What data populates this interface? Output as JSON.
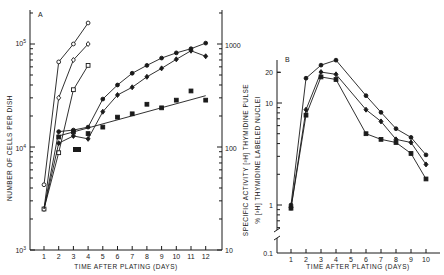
{
  "chart_data": [
    {
      "panel": "A",
      "type": "line",
      "title": "",
      "xlabel": "TIME AFTER PLATING (DAYS)",
      "ylabel": "NUMBER OF CELLS PER DISH",
      "y2label": "",
      "yscale": "log",
      "ylim": [
        1000,
        200000
      ],
      "y2lim": [
        10,
        2000
      ],
      "yticks": [
        "10^3",
        "10^4",
        "10^5"
      ],
      "y2ticks": [
        "10",
        "100",
        "1000"
      ],
      "x": [
        1,
        2,
        3,
        4,
        5,
        6,
        7,
        8,
        9,
        10,
        11,
        12
      ],
      "xticks": [
        "1",
        "2",
        "3",
        "4",
        "5",
        "6",
        "7",
        "8",
        "9",
        "10",
        "11",
        "12"
      ],
      "grid": false,
      "series": [
        {
          "name": "open circles (cells/dish)",
          "axis": "left",
          "marker": "open-circle",
          "x": [
            1,
            2,
            3,
            4
          ],
          "values": [
            4300,
            67000,
            100000,
            160000
          ]
        },
        {
          "name": "open diamonds (cells/dish)",
          "axis": "left",
          "marker": "open-diamond",
          "x": [
            1,
            2,
            3,
            4
          ],
          "values": [
            2500,
            30000,
            70000,
            100000
          ]
        },
        {
          "name": "open squares (cells/dish)",
          "axis": "left",
          "marker": "open-square",
          "x": [
            1,
            2,
            3,
            4
          ],
          "values": [
            2500,
            8800,
            36000,
            62000
          ]
        },
        {
          "name": "filled circles (specific activity)",
          "axis": "right",
          "marker": "filled-circle",
          "x": [
            2,
            3,
            4,
            5,
            6,
            7,
            8,
            9,
            10,
            11,
            12
          ],
          "values": [
            141,
            146,
            156,
            292,
            400,
            520,
            620,
            730,
            820,
            900,
            1020
          ]
        },
        {
          "name": "filled diamonds (specific activity)",
          "axis": "right",
          "marker": "filled-diamond",
          "x": [
            2,
            3,
            4,
            5,
            6,
            7,
            8,
            9,
            10,
            11,
            12
          ],
          "values": [
            109,
            128,
            120,
            220,
            320,
            380,
            480,
            580,
            710,
            860,
            760
          ]
        },
        {
          "name": "filled squares (specific activity)",
          "axis": "right",
          "marker": "filled-square",
          "x": [
            2,
            3,
            4,
            5,
            6,
            7,
            8,
            9,
            10,
            11,
            12
          ],
          "values": [
            125,
            140,
            135,
            156,
            195,
            210,
            260,
            240,
            285,
            350,
            285
          ],
          "fit_line": {
            "x": [
              2,
              12
            ],
            "values": [
              128,
              315
            ]
          }
        }
      ],
      "annotations": [
        "A",
        "black bar at day ~3.2 (plating marker)"
      ]
    },
    {
      "panel": "B",
      "type": "line",
      "title": "",
      "xlabel": "TIME AFTER PLATING (DAYS)",
      "ylabel": "SPECIFIC ACTIVITY [3H] THYMIDINE PULSE / % [3H] THYMIDINE LABELED NUCLEI",
      "yscale": "log",
      "ylim": [
        0.1,
        30
      ],
      "yticks": [
        "0.1",
        "1",
        "10",
        "20"
      ],
      "x": [
        1,
        2,
        3,
        4,
        6,
        7,
        8,
        9,
        10
      ],
      "xticks": [
        "1",
        "2",
        "3",
        "4",
        "5",
        "6",
        "7",
        "8",
        "9",
        "10"
      ],
      "grid": false,
      "axis_break": true,
      "series": [
        {
          "name": "series 1 (circles)",
          "marker": "filled-circle",
          "values": [
            1.0,
            17.5,
            23.5,
            26.3,
            11.8,
            8.1,
            5.6,
            4.6,
            3.1
          ]
        },
        {
          "name": "series 2 (diamonds)",
          "marker": "filled-diamond",
          "values": [
            0.94,
            8.6,
            20.1,
            19.1,
            8.6,
            6.6,
            4.4,
            4.1,
            2.5
          ]
        },
        {
          "name": "series 3 (squares)",
          "marker": "filled-square",
          "values": [
            0.93,
            7.6,
            18.0,
            17.0,
            5.0,
            4.4,
            4.1,
            3.2,
            1.8
          ]
        }
      ],
      "annotations": [
        "B"
      ]
    }
  ],
  "panelA": {
    "label": "A",
    "xlabel": "TIME AFTER PLATING (DAYS)",
    "ylabel": "NUMBER OF CELLS PER DISH",
    "yticks": [
      {
        "text": "10",
        "sup": "3",
        "y": 250
      },
      {
        "text": "10",
        "sup": "4",
        "y": 148
      },
      {
        "text": "10",
        "sup": "5",
        "y": 43
      }
    ],
    "y2ticks": [
      {
        "text": "10",
        "y": 250
      },
      {
        "text": "100",
        "y": 148
      },
      {
        "text": "1000",
        "y": 45
      }
    ],
    "xticks": [
      "1",
      "2",
      "3",
      "4",
      "5",
      "6",
      "7",
      "8",
      "9",
      "10",
      "11",
      "12"
    ]
  },
  "panelB": {
    "label": "B",
    "xlabel": "TIME AFTER PLATING (DAYS)",
    "ylabel_line1": "SPECIFIC ACTIVITY [³H] THYMIDINE PULSE",
    "ylabel_line2": "% [³H] THYMIDINE LABELED NUCLEI",
    "yticks": [
      {
        "text": "0.1",
        "y": 253
      },
      {
        "text": "1",
        "y": 205
      },
      {
        "text": "10",
        "y": 103
      },
      {
        "text": "20",
        "y": 72
      }
    ],
    "xticks": [
      "1",
      "2",
      "3",
      "4",
      "5",
      "6",
      "7",
      "8",
      "9",
      "10"
    ]
  }
}
